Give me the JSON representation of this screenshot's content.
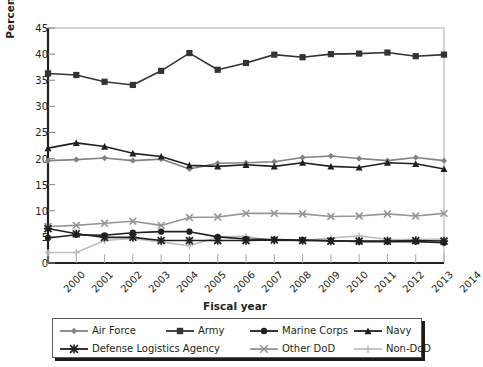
{
  "chart_data": {
    "type": "line",
    "title": "",
    "xlabel": "Fiscal year",
    "ylabel": "Percentage of DFAS revenue",
    "categories": [
      "2000",
      "2001",
      "2002",
      "2003",
      "2004",
      "2005",
      "2006",
      "2007",
      "2008",
      "2009",
      "2010",
      "2011",
      "2012",
      "2013",
      "2014"
    ],
    "x": [
      2000,
      2001,
      2002,
      2003,
      2004,
      2005,
      2006,
      2007,
      2008,
      2009,
      2010,
      2011,
      2012,
      2013,
      2014
    ],
    "ylim": [
      0,
      45
    ],
    "yticks": [
      0,
      5,
      10,
      15,
      20,
      25,
      30,
      35,
      40,
      45
    ],
    "grid": false,
    "legend_position": "bottom",
    "series": [
      {
        "name": "Air Force",
        "marker": "diamond",
        "color": "#808285",
        "values": [
          19.6,
          19.8,
          20.1,
          19.6,
          19.9,
          18.0,
          19.1,
          19.2,
          19.4,
          20.2,
          20.5,
          20.0,
          19.6,
          20.2,
          19.6
        ]
      },
      {
        "name": "Army",
        "marker": "square",
        "color": "#333333",
        "values": [
          36.3,
          36.0,
          34.7,
          34.1,
          36.8,
          40.2,
          37.0,
          38.3,
          39.9,
          39.4,
          40.0,
          40.1,
          40.3,
          39.6,
          39.9
        ]
      },
      {
        "name": "Marine Corps",
        "marker": "circle",
        "color": "#231f20",
        "values": [
          4.8,
          5.4,
          5.3,
          5.8,
          6.0,
          6.0,
          5.0,
          4.6,
          4.5,
          4.4,
          4.3,
          4.1,
          4.1,
          4.1,
          3.9
        ]
      },
      {
        "name": "Navy",
        "marker": "triangle",
        "color": "#231f20",
        "values": [
          22.0,
          23.0,
          22.3,
          21.0,
          20.4,
          18.7,
          18.5,
          18.8,
          18.5,
          19.2,
          18.5,
          18.3,
          19.2,
          19.0,
          18.0
        ]
      },
      {
        "name": "Defense Logistics Agency",
        "marker": "asterisk",
        "color": "#231f20",
        "values": [
          6.6,
          5.6,
          4.9,
          4.9,
          4.3,
          4.3,
          4.3,
          4.3,
          4.4,
          4.3,
          4.2,
          4.2,
          4.2,
          4.3,
          4.2
        ]
      },
      {
        "name": "Other DoD",
        "marker": "x",
        "color": "#939598",
        "values": [
          7.0,
          7.2,
          7.6,
          8.0,
          7.2,
          8.7,
          8.8,
          9.5,
          9.5,
          9.4,
          8.9,
          9.0,
          9.4,
          9.0,
          9.5
        ]
      },
      {
        "name": "Non-DoD",
        "marker": "plus",
        "color": "#bcbec0",
        "values": [
          2.0,
          2.0,
          4.3,
          4.7,
          4.0,
          3.3,
          5.0,
          5.1,
          4.2,
          4.3,
          4.8,
          5.2,
          4.5,
          4.5,
          4.6
        ]
      }
    ]
  },
  "axes": {
    "y_tick_labels": [
      "0",
      "5",
      "10",
      "15",
      "20",
      "25",
      "30",
      "35",
      "40",
      "45"
    ],
    "x_tick_labels": [
      "2000",
      "2001",
      "2002",
      "2003",
      "2004",
      "2005",
      "2006",
      "2007",
      "2008",
      "2009",
      "2010",
      "2011",
      "2012",
      "2013",
      "2014"
    ]
  },
  "legend": {
    "rows": [
      [
        "Air Force",
        "Army",
        "Marine Corps",
        "Navy"
      ],
      [
        "Defense Logistics Agency",
        "Other DoD",
        "Non-DoD"
      ]
    ]
  }
}
